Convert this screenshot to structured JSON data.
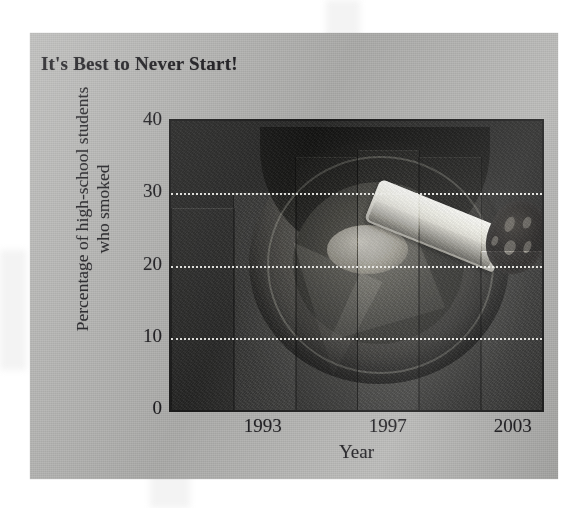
{
  "figure": {
    "title": "It's Best to Never Start!",
    "background_color": "#b3b3b1",
    "page_color": "#ffffff"
  },
  "chart_data": {
    "type": "bar",
    "title": "It's Best to Never Start!",
    "xlabel": "Year",
    "ylabel": "Percentage of high-school students who smoked",
    "ylabel_line1": "Percentage of high-school students",
    "ylabel_line2": "who smoked",
    "ylim": [
      0,
      40
    ],
    "yticks": [
      0,
      10,
      20,
      30,
      40
    ],
    "ytick_labels": [
      "0",
      "10",
      "20",
      "30",
      "40"
    ],
    "grid": "horizontal-dotted-white",
    "legend": "none",
    "categories": [
      "1991",
      "1993",
      "1995",
      "1997",
      "1999",
      "2003"
    ],
    "xtick_labels": [
      "1993",
      "1997",
      "2003"
    ],
    "xtick_positions": [
      1,
      3,
      5
    ],
    "values": [
      28,
      30,
      35,
      36,
      35,
      22
    ],
    "bar_fill": "photographic-image-fill",
    "image_subject": "lit cigarette resting in an ashtray"
  },
  "axis": {
    "y_ticks": [
      {
        "label": "40",
        "value": 40
      },
      {
        "label": "30",
        "value": 30
      },
      {
        "label": "20",
        "value": 20
      },
      {
        "label": "10",
        "value": 10
      },
      {
        "label": "0",
        "value": 0
      }
    ],
    "x_ticks": [
      {
        "label": "1993",
        "index": 1
      },
      {
        "label": "1997",
        "index": 3
      },
      {
        "label": "2003",
        "index": 5
      }
    ],
    "x_title": "Year"
  },
  "photo": {
    "description": "lit cigarette with glowing ash tip over a dark round ashtray",
    "parts": [
      "cigarette-paper",
      "cigarette-ember",
      "ashtray-disc",
      "ashtray-rim"
    ]
  }
}
